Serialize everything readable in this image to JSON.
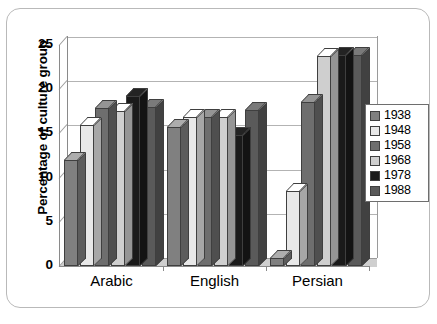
{
  "figure": {
    "caption_fragment": ""
  },
  "chart_data": {
    "type": "bar",
    "title": "",
    "xlabel": "",
    "ylabel": "Percentage of culture group",
    "ylim": [
      0,
      25
    ],
    "yticks": [
      0,
      5,
      10,
      15,
      20,
      25
    ],
    "ytick_labels": [
      "0",
      "5",
      "10",
      "15",
      "20",
      "25"
    ],
    "grid": true,
    "legend_position": "right",
    "three_d": true,
    "categories": [
      "Arabic",
      "English",
      "Persian"
    ],
    "series": [
      {
        "name": "1938",
        "color": "#808080",
        "values": [
          12.0,
          15.7,
          0.9
        ]
      },
      {
        "name": "1948",
        "color": "#e8e8e8",
        "values": [
          15.9,
          16.8,
          8.5
        ]
      },
      {
        "name": "1958",
        "color": "#6e6e6e",
        "values": [
          17.9,
          16.8,
          18.5
        ]
      },
      {
        "name": "1968",
        "color": "#cfcfcf",
        "values": [
          17.5,
          16.8,
          23.7
        ]
      },
      {
        "name": "1978",
        "color": "#1a1a1a",
        "values": [
          19.2,
          14.8,
          23.9
        ]
      },
      {
        "name": "1988",
        "color": "#5a5a5a",
        "values": [
          18.0,
          17.7,
          23.9
        ]
      }
    ]
  }
}
